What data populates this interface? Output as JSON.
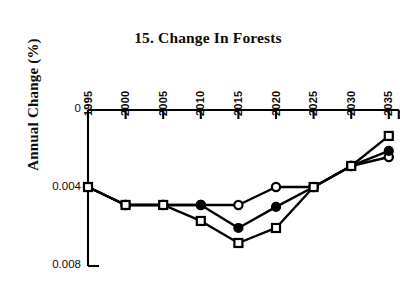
{
  "chart_data": {
    "type": "line",
    "title": "15. Change In Forests",
    "xlabel": "",
    "ylabel": "Annual Change (%)",
    "x": [
      1995,
      2000,
      2005,
      2010,
      2015,
      2020,
      2025,
      2030,
      2035
    ],
    "xtick_labels": [
      "1995",
      "2000",
      "2005",
      "2010",
      "2015",
      "2020",
      "2025",
      "2030",
      "2035"
    ],
    "ytick_labels": [
      "0",
      "0.004",
      "0.008"
    ],
    "ytick_values": [
      0,
      0.004,
      0.008
    ],
    "ylim": [
      0,
      0.008
    ],
    "y_axis_direction": "inverted (0 at top, 0.008 at bottom; values are magnitudes of negative annual change)",
    "xlim": [
      1995,
      2035
    ],
    "grid": false,
    "legend": "none",
    "series": [
      {
        "name": "open-circle-series",
        "marker": "open-circle",
        "x": [
          1995,
          2000,
          2005,
          2010,
          2015,
          2020,
          2025,
          2030,
          2035
        ],
        "values": [
          0.00395,
          0.00487,
          0.00487,
          0.00487,
          0.00487,
          0.00395,
          0.00395,
          0.00287,
          0.00241
        ]
      },
      {
        "name": "filled-circle-series",
        "marker": "filled-circle",
        "x": [
          1995,
          2000,
          2005,
          2010,
          2015,
          2020,
          2025,
          2030,
          2035
        ],
        "values": [
          0.00395,
          0.00487,
          0.00487,
          0.00487,
          0.00605,
          0.00497,
          0.00395,
          0.00287,
          0.0021
        ]
      },
      {
        "name": "open-square-series",
        "marker": "open-square",
        "x": [
          1995,
          2000,
          2005,
          2010,
          2015,
          2020,
          2025,
          2030,
          2035
        ],
        "values": [
          0.00395,
          0.00487,
          0.00487,
          0.00569,
          0.00682,
          0.00605,
          0.00395,
          0.00287,
          0.00133
        ]
      }
    ]
  },
  "axes": {
    "tick_count_x": 9,
    "tick_count_y": 3
  }
}
